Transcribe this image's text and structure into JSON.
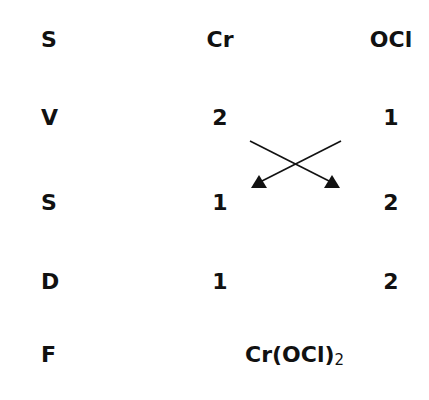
{
  "header": {
    "label": "S",
    "cation": "Cr",
    "anion": "OCl"
  },
  "rows": [
    {
      "label": "V",
      "cation": "2",
      "anion": "1"
    },
    {
      "label": "S",
      "cation": "1",
      "anion": "2"
    },
    {
      "label": "D",
      "cation": "1",
      "anion": "2"
    }
  ],
  "final": {
    "label": "F",
    "formula_main": "Cr(OCl)",
    "formula_subscript": "2"
  },
  "arrows": {
    "description": "criss-cross swap of valencies",
    "color": "#111111"
  }
}
